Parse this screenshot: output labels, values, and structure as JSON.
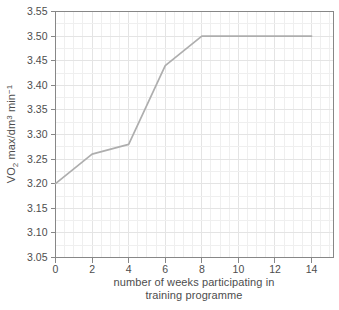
{
  "figure": {
    "background": "#ffffff"
  },
  "chart_data": {
    "type": "line",
    "title": "",
    "x": [
      0,
      2,
      4,
      6,
      8,
      14
    ],
    "y": [
      3.2,
      3.26,
      3.28,
      3.44,
      3.5,
      3.5
    ],
    "xlim": [
      0,
      15.2
    ],
    "ylim": [
      3.05,
      3.55
    ],
    "x_ticks": [
      0,
      2,
      4,
      6,
      8,
      10,
      12,
      14
    ],
    "x_tick_labels": [
      "0",
      "2",
      "4",
      "6",
      "8",
      "10",
      "12",
      "14"
    ],
    "y_ticks": [
      3.05,
      3.1,
      3.15,
      3.2,
      3.25,
      3.3,
      3.35,
      3.4,
      3.45,
      3.5,
      3.55
    ],
    "y_tick_labels": [
      "3.05",
      "3.10",
      "3.15",
      "3.20",
      "3.25",
      "3.30",
      "3.35",
      "3.40",
      "3.45",
      "3.50",
      "3.55"
    ],
    "xlabel": "number of weeks participating in training programme",
    "xlabel_lines": [
      "number of weeks participating in",
      "training programme"
    ],
    "ylabel": "VO2 max/dm3 min-1",
    "ylabel_parts": [
      {
        "text": "VO",
        "script": "normal"
      },
      {
        "text": "2",
        "script": "sub"
      },
      {
        "text": " max/dm",
        "script": "normal"
      },
      {
        "text": "3",
        "script": "sup"
      },
      {
        "text": " min",
        "script": "normal"
      },
      {
        "text": "−1",
        "script": "sup"
      }
    ],
    "legend": null,
    "grid": {
      "on": true,
      "minor_x_step": 0.5,
      "minor_y_step": 0.025
    },
    "colors": {
      "line": "#aeaeae",
      "axis": "#878787",
      "grid_minor": "#efefef",
      "grid_major": "#e4e4e4",
      "text": "#4d4d4d",
      "background": "#ffffff"
    }
  }
}
